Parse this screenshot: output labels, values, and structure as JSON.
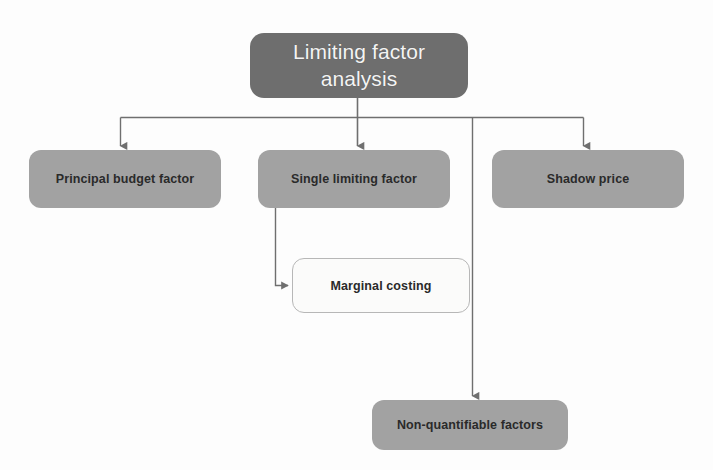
{
  "diagram": {
    "title": "Limiting factor analysis",
    "background_color": "#fdfdfd",
    "root": {
      "label": "Limiting factor\nanalysis",
      "fill_color": "#6e6e6e",
      "text_color": "#f4f4f4"
    },
    "branches": [
      {
        "id": "principal-budget-factor",
        "label": "Principal budget factor",
        "fill_color": "#a2a2a2",
        "text_color": "#2a2a2a"
      },
      {
        "id": "single-limiting-factor",
        "label": "Single limiting factor",
        "fill_color": "#a2a2a2",
        "text_color": "#2a2a2a"
      },
      {
        "id": "shadow-price",
        "label": "Shadow price",
        "fill_color": "#a2a2a2",
        "text_color": "#2a2a2a"
      }
    ],
    "sub_nodes": [
      {
        "id": "marginal-costing",
        "label": "Marginal costing",
        "fill_color": "#fbfbfa",
        "text_color": "#2a2a2a",
        "border_color": "#b7b7b7",
        "parent": "single-limiting-factor"
      },
      {
        "id": "non-quantifiable-factors",
        "label": "Non-quantifiable factors",
        "fill_color": "#a2a2a2",
        "text_color": "#2a2a2a",
        "parent": "limiting-factor-analysis"
      }
    ],
    "connector_color": "#6f6f6f"
  }
}
